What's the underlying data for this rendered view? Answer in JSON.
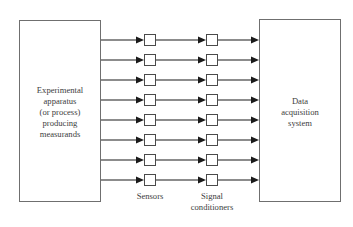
{
  "figure": {
    "kind": "block-diagram",
    "background_color": "#ffffff",
    "line_color": "#1a1a1a",
    "box_border_color": "#6f6f6f",
    "text_color": "#3d3d3d",
    "width": 353,
    "height": 227
  },
  "left_block": {
    "name": "experimental-apparatus-block",
    "lines": [
      "Experimental",
      "apparatus",
      "(or process)",
      "producing",
      "measurands"
    ],
    "line_1": "Experimental",
    "line_2": "apparatus",
    "line_3": "(or process)",
    "line_4": "producing",
    "line_5": "measurands",
    "x": 19,
    "y": 20,
    "width": 82,
    "height": 182
  },
  "right_block": {
    "name": "data-acquisition-system-block",
    "lines": [
      "Data",
      "acquisition",
      "system"
    ],
    "line_1": "Data",
    "line_2": "acquisition",
    "line_3": "system",
    "x": 259,
    "y": 19,
    "width": 82,
    "height": 183
  },
  "channels": {
    "count": 8,
    "row_centers": [
      40,
      60,
      80,
      100,
      120,
      140,
      160,
      180
    ],
    "sensor_x": 144,
    "conditioner_x": 206,
    "node_size": 12
  },
  "labels": {
    "sensors": "Sensors",
    "signal_conditioners_line_1": "Signal",
    "signal_conditioners_line_2": "conditioners"
  }
}
